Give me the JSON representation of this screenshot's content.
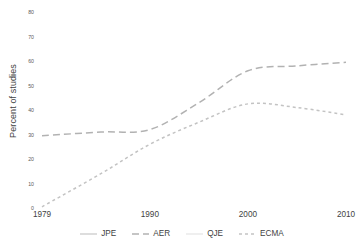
{
  "chart_data": {
    "type": "line",
    "title": "",
    "subtitle": "",
    "xlabel": "",
    "ylabel": "Percent of studies",
    "xlim": [
      1979,
      2010
    ],
    "ylim": [
      0,
      80
    ],
    "grid": false,
    "legend_position": "bottom",
    "x_ticks": [
      "1979",
      "1990",
      "2000",
      "2010"
    ],
    "x_tick_values": [
      1979,
      1990,
      2000,
      2010
    ],
    "y_ticks": [
      "0",
      "10",
      "20",
      "30",
      "40",
      "50",
      "60",
      "70",
      "80"
    ],
    "y_tick_values": [
      0,
      10,
      20,
      30,
      40,
      50,
      60,
      70,
      80
    ],
    "x": [
      1979,
      1985,
      1990,
      1995,
      2000,
      2005,
      2010
    ],
    "series": [
      {
        "name": "JPE",
        "style": "solid",
        "color": "#d8d8d8",
        "visible": false,
        "values": [
          null,
          null,
          null,
          null,
          null,
          null,
          null
        ]
      },
      {
        "name": "AER",
        "style": "long-dash",
        "color": "#b2b2b2",
        "visible": true,
        "values": [
          29.5,
          31.0,
          32.0,
          43.0,
          56.0,
          58.0,
          59.5
        ]
      },
      {
        "name": "QJE",
        "style": "solid",
        "color": "#e2e2e2",
        "visible": false,
        "values": [
          null,
          null,
          null,
          null,
          null,
          null,
          null
        ]
      },
      {
        "name": "ECMA",
        "style": "dotted",
        "color": "#c3c3c3",
        "visible": true,
        "values": [
          0.5,
          14.0,
          26.0,
          35.0,
          42.5,
          41.0,
          38.0
        ]
      }
    ]
  },
  "axis": {
    "y_title": "Percent of studies"
  },
  "legend": {
    "items": [
      {
        "label": "JPE",
        "style": "solid",
        "color": "#cfcfcf"
      },
      {
        "label": "AER",
        "style": "long-dash",
        "color": "#b2b2b2"
      },
      {
        "label": "QJE",
        "style": "solid",
        "color": "#e8e8e8"
      },
      {
        "label": "ECMA",
        "style": "dotted",
        "color": "#c3c3c3"
      }
    ]
  },
  "colors": {
    "background": "#ffffff",
    "text": "#3f3f3f",
    "tick_text": "#5a5a5a",
    "aer_line": "#b2b2b2",
    "ecma_line": "#c3c3c3"
  }
}
